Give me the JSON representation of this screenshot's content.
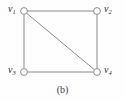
{
  "figure": {
    "caption": "(b)",
    "background_color": "#fefefe",
    "edge_color": "#8a8a8a",
    "vertex_stroke_color": "#8a8a8a",
    "vertex_fill_color": "#ffffff",
    "label_color": "#2b2b2b"
  },
  "graph": {
    "type": "undirected-graph",
    "vertex_count": 4,
    "edge_count": 5,
    "vertices": [
      {
        "id": "v1",
        "label": "v",
        "subscript": "1",
        "x": 24,
        "y": 11,
        "radius": 3.6,
        "position": "top-left"
      },
      {
        "id": "v2",
        "label": "v",
        "subscript": "2",
        "x": 97,
        "y": 11,
        "radius": 3.6,
        "position": "top-right"
      },
      {
        "id": "v3",
        "label": "v",
        "subscript": "3",
        "x": 24,
        "y": 72,
        "radius": 3.6,
        "position": "bottom-left"
      },
      {
        "id": "v4",
        "label": "v",
        "subscript": "4",
        "x": 97,
        "y": 72,
        "radius": 3.6,
        "position": "bottom-right"
      }
    ],
    "edges": [
      {
        "id": "e-v1-v2",
        "from": "v1",
        "to": "v2",
        "kind": "top-edge"
      },
      {
        "id": "e-v1-v3",
        "from": "v1",
        "to": "v3",
        "kind": "left-edge"
      },
      {
        "id": "e-v2-v4",
        "from": "v2",
        "to": "v4",
        "kind": "right-edge"
      },
      {
        "id": "e-v3-v4",
        "from": "v3",
        "to": "v4",
        "kind": "bottom-edge"
      },
      {
        "id": "e-v1-v4",
        "from": "v1",
        "to": "v4",
        "kind": "diagonal"
      }
    ]
  },
  "labels": {
    "v1": {
      "base": "v",
      "sub": "1"
    },
    "v2": {
      "base": "v",
      "sub": "2"
    },
    "v3": {
      "base": "v",
      "sub": "3"
    },
    "v4": {
      "base": "v",
      "sub": "4"
    }
  }
}
